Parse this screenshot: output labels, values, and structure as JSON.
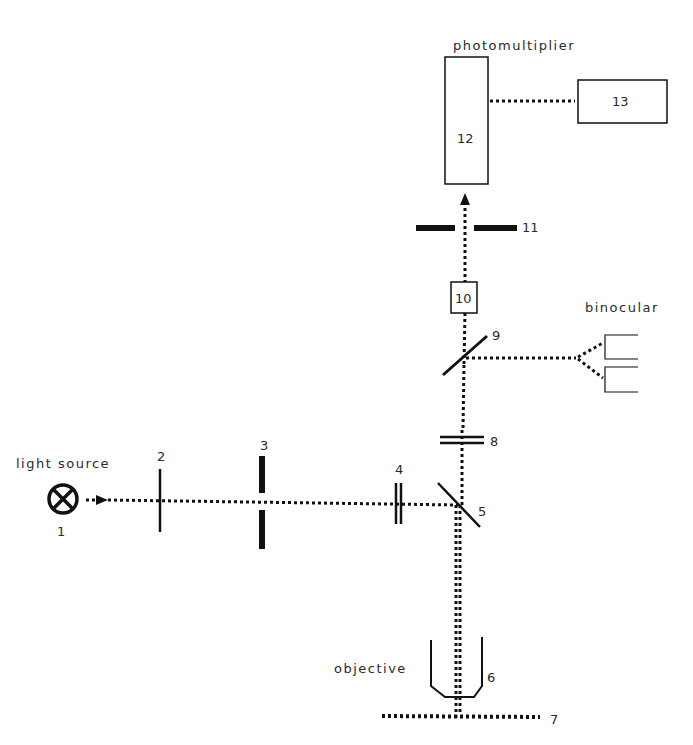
{
  "labels": {
    "light_source": "light source",
    "photomultiplier": "photomultiplier",
    "binocular": "binocular",
    "objective": "objective"
  },
  "components": {
    "c1": "1",
    "c2": "2",
    "c3": "3",
    "c4": "4",
    "c5": "5",
    "c6": "6",
    "c7": "7",
    "c8": "8",
    "c9": "9",
    "c10": "10",
    "c11": "11",
    "c12": "12",
    "c13": "13"
  },
  "colors": {
    "line": "#111111",
    "text": "#2a2a2a",
    "background": "#ffffff"
  }
}
